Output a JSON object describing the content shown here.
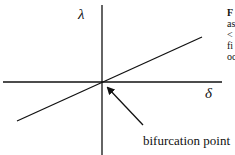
{
  "diagram": {
    "y_axis_label": "λ",
    "x_axis_label": "δ",
    "annotation": "bifurcation point",
    "line": {
      "from": [
        17,
        121
      ],
      "to": [
        202,
        37
      ]
    },
    "origin": [
      102,
      82
    ]
  },
  "side_text": {
    "lines": [
      "F",
      "as",
      "<",
      "fi",
      "oc"
    ]
  }
}
